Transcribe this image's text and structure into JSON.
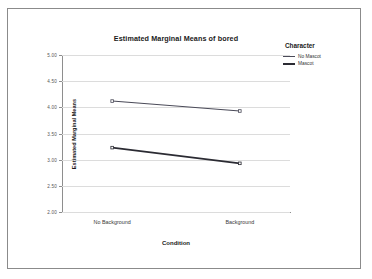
{
  "chart_data": {
    "type": "line",
    "title": "Estimated Marginal Means of bored",
    "xlabel": "Condition",
    "ylabel": "Estimated Marginal Means",
    "categories": [
      "No Background",
      "Background"
    ],
    "ylim": [
      2.0,
      5.0
    ],
    "yticks": [
      "2.00",
      "2.50",
      "3.00",
      "3.50",
      "4.00",
      "4.50",
      "5.00"
    ],
    "ytick_values": [
      2.0,
      2.5,
      3.0,
      3.5,
      4.0,
      4.5,
      5.0
    ],
    "grid": true,
    "legend_position": "right",
    "legend_title": "Character",
    "series": [
      {
        "name": "No Mascot",
        "values": [
          4.12,
          3.93
        ],
        "color": "#4a4a58",
        "width": 1.1
      },
      {
        "name": "Mascot",
        "values": [
          3.23,
          2.93
        ],
        "color": "#2b2b33",
        "width": 1.9
      }
    ]
  }
}
